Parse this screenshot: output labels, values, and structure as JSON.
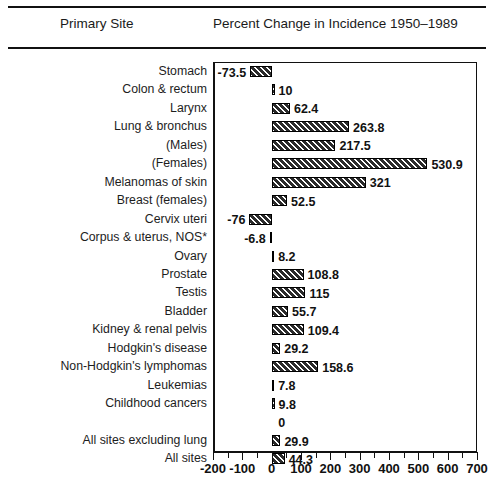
{
  "header": {
    "col_site": "Primary Site",
    "col_chart": "Percent Change in Incidence 1950–1989"
  },
  "chart_data": {
    "type": "bar",
    "orientation": "horizontal",
    "title": "Percent Change in Incidence 1950–1989",
    "xlabel": "",
    "ylabel": "Primary Site",
    "xlim": [
      -200,
      700
    ],
    "xticks": [
      -200,
      -100,
      0,
      100,
      200,
      300,
      400,
      500,
      600,
      700
    ],
    "xticklabels": [
      "-200",
      "-100",
      "0",
      "100",
      "200",
      "300",
      "400",
      "500",
      "600",
      "700"
    ],
    "minor_tick_step": 50,
    "grid": false,
    "legend": "none",
    "categories": [
      "Stomach",
      "Colon & rectum",
      "Larynx",
      "Lung & bronchus",
      "(Males)",
      "(Females)",
      "Melanomas of skin",
      "Breast (females)",
      "Cervix uteri",
      "Corpus & uterus, NOS*",
      "Ovary",
      "Prostate",
      "Testis",
      "Bladder",
      "Kidney & renal pelvis",
      "Hodgkin's disease",
      "Non-Hodgkin's lymphomas",
      "Leukemias",
      "Childhood cancers",
      "",
      "All sites excluding lung",
      "All sites"
    ],
    "values": [
      -73.5,
      10,
      62.4,
      263.8,
      217.5,
      530.9,
      321,
      52.5,
      -76,
      -6.8,
      8.2,
      108.8,
      115,
      55.7,
      109.4,
      29.2,
      158.6,
      7.8,
      9.8,
      null,
      29.9,
      44.3
    ],
    "value_labels": [
      "-73.5",
      "10",
      "62.4",
      "263.8",
      "217.5",
      "530.9",
      "321",
      "52.5",
      "-76",
      "-6.8",
      "8.2",
      "108.8",
      "115",
      "55.7",
      "109.4",
      "29.2",
      "158.6",
      "7.8",
      "9.8",
      "0",
      "29.9",
      "44.3"
    ],
    "bar_style": {
      "fill": "#2b2b2b",
      "hatch": "diagonal-white-lines",
      "edge": "#000000"
    }
  }
}
